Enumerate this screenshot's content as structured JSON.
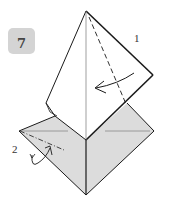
{
  "diagram": {
    "step_number": "7",
    "labels": [
      {
        "id": "1",
        "text": "1"
      },
      {
        "id": "2",
        "text": "2"
      }
    ],
    "colors": {
      "paper_shaded": "#dcdcdc",
      "paper_white": "#ffffff",
      "line": "#1a1a1a",
      "badge": "#d4d4d4"
    }
  }
}
